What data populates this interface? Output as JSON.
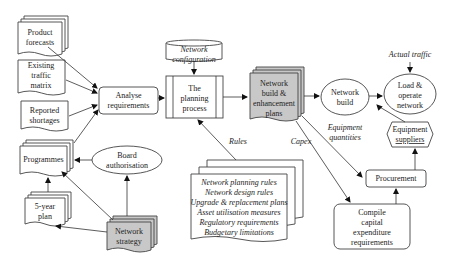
{
  "nodes": {
    "product_forecasts": {
      "line1": "Product",
      "line2": "forecasts"
    },
    "existing_traffic": {
      "line1": "Existing",
      "line2": "traffic",
      "line3": "matrix"
    },
    "reported_shortages": {
      "line1": "Reported",
      "line2": "shortages"
    },
    "programmes": {
      "line1": "Programmes"
    },
    "board_authorisation": {
      "line1": "Board",
      "line2": "authorisation"
    },
    "five_year_plan": {
      "line1": "5-year",
      "line2": "plan"
    },
    "network_strategy": {
      "line1": "Network",
      "line2": "strategy"
    },
    "analyse_requirements": {
      "line1": "Analyse",
      "line2": "requirements"
    },
    "network_configuration": {
      "line1": "Network",
      "line2": "configuration"
    },
    "planning_process": {
      "line1": "The",
      "line2": "planning",
      "line3": "process"
    },
    "network_plans": {
      "line1": "Network",
      "line2": "build &",
      "line3": "enhancement",
      "line4": "plans"
    },
    "network_build": {
      "line1": "Network",
      "line2": "build"
    },
    "load_operate": {
      "line1": "Load &",
      "line2": "operate",
      "line3": "network"
    },
    "equipment_suppliers": {
      "line1": "Equipment",
      "line2": "suppliers"
    },
    "procurement": {
      "line1": "Procurement"
    },
    "capex": {
      "line1": "Compile",
      "line2": "capital",
      "line3": "expenditure",
      "line4": "requirements"
    },
    "rules_doc": {
      "items": [
        "Network planning rules",
        "Network design rules",
        "Upgrade & replacement plans",
        "Asset utilisation measures",
        "Regulatory requirements",
        "Budgetary limitations"
      ]
    }
  },
  "edge_labels": {
    "rules": "Rules",
    "capex": "Capex",
    "equipment_quantities_1": "Equipment",
    "equipment_quantities_2": "quantities",
    "actual_traffic": "Actual traffic"
  },
  "colors": {
    "shaded_fill": "#c8c8c8",
    "stroke": "#444444"
  }
}
